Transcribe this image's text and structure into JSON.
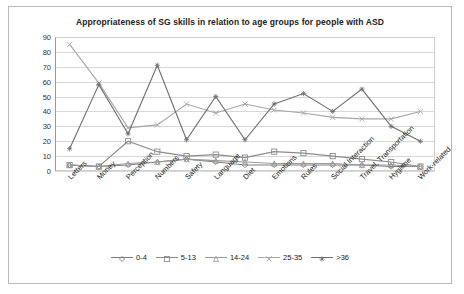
{
  "chart_data": {
    "type": "line",
    "title": "Appropriateness of SG skills in relation to age groups for people with ASD",
    "xlabel": "",
    "ylabel": "",
    "ylim": [
      0,
      90
    ],
    "yticks": [
      0,
      10,
      20,
      30,
      40,
      50,
      60,
      70,
      80,
      90
    ],
    "grid": true,
    "legend_position": "bottom",
    "categories": [
      "Letters",
      "Money",
      "Perception",
      "Numbers",
      "Safety",
      "Language",
      "Diet",
      "Emotions",
      "Rules",
      "Social Interaction",
      "Travel, Transportation",
      "Hygiene",
      "Work-related"
    ],
    "series": [
      {
        "name": "0-4",
        "color": "#7f7f7f",
        "marker": "diamond",
        "values": [
          4,
          3,
          4,
          6,
          8,
          6,
          4,
          4,
          4,
          4,
          4,
          3,
          3
        ]
      },
      {
        "name": "5-13",
        "color": "#8c8c8c",
        "marker": "square",
        "values": [
          4,
          3,
          20,
          13,
          10,
          11,
          9,
          13,
          12,
          10,
          8,
          6,
          3
        ]
      },
      {
        "name": "14-24",
        "color": "#9a9a9a",
        "marker": "triangle",
        "values": [
          4,
          3,
          5,
          6,
          8,
          7,
          6,
          5,
          5,
          5,
          4,
          4,
          3
        ]
      },
      {
        "name": "25-35",
        "color": "#a6a6a6",
        "marker": "cross",
        "values": [
          85,
          59,
          29,
          31,
          45,
          39,
          45,
          41,
          39,
          36,
          35,
          35,
          40
        ]
      },
      {
        "name": ">36",
        "color": "#6f6f6f",
        "marker": "asterisk",
        "values": [
          15,
          58,
          25,
          71,
          21,
          50,
          21,
          45,
          52,
          40,
          55,
          30,
          20
        ]
      }
    ]
  },
  "legend": {
    "items": [
      {
        "label": "0-4"
      },
      {
        "label": "5-13"
      },
      {
        "label": "14-24"
      },
      {
        "label": "25-35"
      },
      {
        "label": ">36"
      }
    ]
  }
}
